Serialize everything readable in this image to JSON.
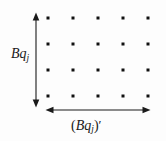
{
  "figure": {
    "type": "lattice-diagram",
    "background_color": "#fdfdfd",
    "ink_color": "#1a1a1a",
    "labels": {
      "vertical": {
        "text": "Bq_j",
        "base": "B",
        "variable": "q",
        "subscript": "j",
        "prime": false
      },
      "horizontal": {
        "text": "(Bq_j)'",
        "open_paren": "(",
        "base": "B",
        "variable": "q",
        "subscript": "j",
        "close_paren": ")",
        "prime": "′"
      }
    },
    "grid": {
      "columns": 5,
      "rows": 4,
      "column_x": [
        48,
        73,
        98,
        123,
        148
      ],
      "row_y": [
        18,
        44,
        70,
        96
      ],
      "dot_size": 3,
      "dot_color": "#111111"
    },
    "arrows": {
      "vertical": {
        "x": 36,
        "y_start": 15,
        "y_end": 105,
        "double_headed": true,
        "stroke_width": 1.1
      },
      "horizontal": {
        "y": 110,
        "x_start": 48,
        "x_end": 148,
        "double_headed": true,
        "stroke_width": 1.1
      }
    }
  }
}
